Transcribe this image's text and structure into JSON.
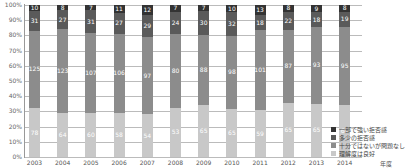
{
  "chart_data": {
    "type": "bar",
    "stacked": true,
    "percent": true,
    "title": "",
    "xlabel": "年度",
    "ylabel": "",
    "ylim": [
      0,
      100
    ],
    "yticks": [
      "0%",
      "10%",
      "20%",
      "30%",
      "40%",
      "50%",
      "60%",
      "70%",
      "80%",
      "90%",
      "100%"
    ],
    "categories": [
      "2003",
      "2004",
      "2005",
      "2006",
      "2007",
      "2008",
      "2009",
      "2010",
      "2011",
      "2012",
      "2013",
      "2014"
    ],
    "series": [
      {
        "name": "理解度は良好",
        "color": "#c8c8c8",
        "values": [
          78,
          64,
          60,
          58,
          54,
          53,
          65,
          65,
          59,
          65,
          65,
          64
        ]
      },
      {
        "name": "十分ではないが問題なし",
        "color": "#8c8c8c",
        "values": [
          125,
          123,
          107,
          106,
          97,
          80,
          88,
          98,
          101,
          87,
          93,
          95
        ]
      },
      {
        "name": "多少の拒否感",
        "color": "#5a5a5a",
        "values": [
          31,
          27,
          31,
          27,
          29,
          24,
          30,
          32,
          18,
          22,
          18,
          19
        ]
      },
      {
        "name": "一部で強い拒否感",
        "color": "#333333",
        "values": [
          10,
          8,
          7,
          11,
          12,
          7,
          7,
          10,
          13,
          8,
          9,
          8
        ]
      }
    ],
    "legend_position": "right-bottom",
    "grid": true
  },
  "legend": [
    {
      "label": "一部で強い拒否感",
      "color": "#333333"
    },
    {
      "label": "多少の拒否感",
      "color": "#5a5a5a"
    },
    {
      "label": "十分ではないが問題なし",
      "color": "#8c8c8c"
    },
    {
      "label": "理解度は良好",
      "color": "#c8c8c8"
    }
  ],
  "x_unit": "年度"
}
